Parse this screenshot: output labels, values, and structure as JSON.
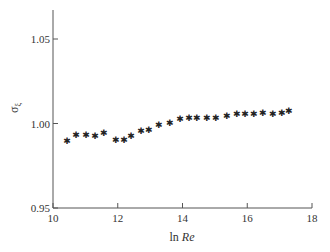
{
  "chart_data": {
    "type": "scatter",
    "title": "",
    "xlabel_prefix": "ln ",
    "xlabel_italic": "Re",
    "xlabel": "ln Re",
    "ylabel": "σξ",
    "ylabel_main": "σ",
    "ylabel_sub": "ξ",
    "xlim": [
      10,
      18
    ],
    "ylim": [
      0.95,
      1.067
    ],
    "xticks": [
      10,
      12,
      14,
      16,
      18
    ],
    "xtick_labels": [
      "10",
      "12",
      "14",
      "16",
      "18"
    ],
    "yticks": [
      0.95,
      1.0,
      1.05
    ],
    "ytick_labels": [
      "0.95",
      "1.00",
      "1.05"
    ],
    "grid": false,
    "legend": null,
    "marker": "*",
    "series": [
      {
        "name": "σξ",
        "x": [
          10.43,
          10.71,
          11.02,
          11.3,
          11.57,
          11.94,
          12.19,
          12.41,
          12.72,
          12.96,
          13.27,
          13.61,
          13.92,
          14.2,
          14.44,
          14.75,
          15.03,
          15.37,
          15.68,
          15.93,
          16.2,
          16.48,
          16.79,
          17.07,
          17.28
        ],
        "y": [
          0.99,
          0.994,
          0.994,
          0.993,
          0.995,
          0.991,
          0.991,
          0.993,
          0.996,
          0.997,
          1.0,
          1.001,
          1.003,
          1.004,
          1.004,
          1.004,
          1.004,
          1.005,
          1.006,
          1.006,
          1.006,
          1.007,
          1.006,
          1.007,
          1.008
        ]
      }
    ]
  }
}
